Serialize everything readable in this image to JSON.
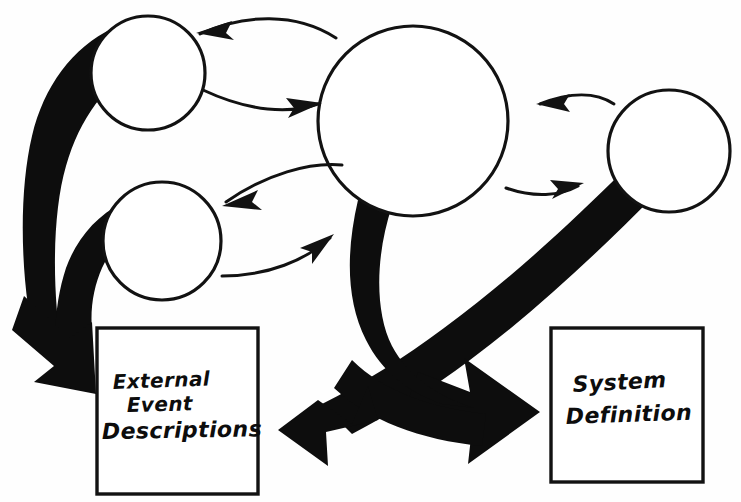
{
  "diagram": {
    "style": "hand-drawn sketch",
    "background_color": "#fefefe",
    "ink_color": "#0d0d0d",
    "canvas": {
      "width": 741,
      "height": 502
    }
  },
  "nodes": [
    {
      "id": "circle-top-left",
      "name": "top-left-circle",
      "label": "",
      "shape": "circle",
      "cx": 148,
      "cy": 73,
      "r": 57
    },
    {
      "id": "circle-bottom-left",
      "name": "bottom-left-circle",
      "label": "",
      "shape": "circle",
      "cx": 162,
      "cy": 241,
      "r": 59
    },
    {
      "id": "circle-center",
      "name": "center-circle",
      "label": "",
      "shape": "circle",
      "cx": 413,
      "cy": 121,
      "r": 95
    },
    {
      "id": "circle-right",
      "name": "right-circle",
      "label": "",
      "shape": "circle",
      "cx": 669,
      "cy": 151,
      "r": 61
    }
  ],
  "boxes": [
    {
      "id": "box-external-event-descriptions",
      "name": "external-event-descriptions-box",
      "lines": [
        "External",
        "Event",
        "Descriptions"
      ],
      "x": 97,
      "y": 328,
      "width": 161,
      "height": 166
    },
    {
      "id": "box-system-definition",
      "name": "system-definition-box",
      "lines": [
        "System",
        "Definition"
      ],
      "x": 551,
      "y": 328,
      "width": 152,
      "height": 154
    }
  ],
  "thin_connectors": [
    {
      "id": "conn-center-to-topleft",
      "name": "center-to-top-left-arrow",
      "from": "circle-center",
      "to": "circle-top-left",
      "direction": "to-top-left"
    },
    {
      "id": "conn-topleft-to-center",
      "name": "top-left-to-center-arrow",
      "from": "circle-top-left",
      "to": "circle-center",
      "direction": "to-center"
    },
    {
      "id": "conn-center-to-bottomleft",
      "name": "center-to-bottom-left-arrow",
      "from": "circle-center",
      "to": "circle-bottom-left",
      "direction": "to-bottom-left"
    },
    {
      "id": "conn-bottomleft-to-center",
      "name": "bottom-left-to-center-arrow",
      "from": "circle-bottom-left",
      "to": "circle-center",
      "direction": "to-center"
    },
    {
      "id": "conn-right-to-center",
      "name": "right-to-center-arrow",
      "from": "circle-right",
      "to": "circle-center",
      "direction": "to-center"
    },
    {
      "id": "conn-center-to-right",
      "name": "center-to-right-arrow",
      "from": "circle-center",
      "to": "circle-right",
      "direction": "to-right"
    }
  ],
  "thick_connectors": [
    {
      "id": "thick-topleft-to-external",
      "name": "top-left-to-external-thick-arrow",
      "from": "circle-top-left",
      "to": "box-external-event-descriptions",
      "direction": "down-left"
    },
    {
      "id": "thick-bottomleft-to-external",
      "name": "bottom-left-to-external-thick-arrow",
      "from": "circle-bottom-left",
      "to": "box-external-event-descriptions",
      "direction": "down-left"
    },
    {
      "id": "thick-center-down-left",
      "name": "center-to-lower-left-thick-arrow",
      "from": "circle-center",
      "to": "lower-left",
      "direction": "down-left"
    },
    {
      "id": "thick-right-to-system",
      "name": "right-to-system-definition-thick-arrow",
      "from": "circle-right",
      "to": "box-system-definition",
      "direction": "down-left-then-right"
    }
  ]
}
